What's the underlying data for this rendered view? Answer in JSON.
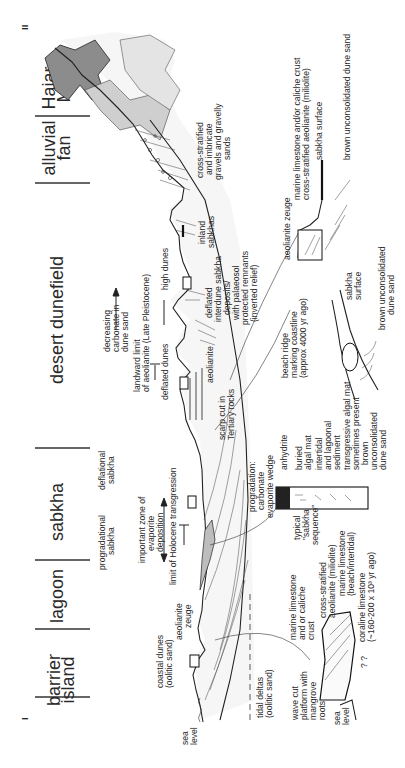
{
  "figure": {
    "orientation": "rotated-90-ccw",
    "section_markers": {
      "start": "I",
      "end": "II"
    }
  },
  "zones": [
    {
      "label_lines": [
        "barrier",
        "island"
      ]
    },
    {
      "label_lines": [
        "lagoon"
      ]
    },
    {
      "label_lines": [
        "sabkha"
      ]
    },
    {
      "label_lines": [
        "desert dunefield"
      ]
    },
    {
      "label_lines": [
        "alluvial",
        "fan"
      ]
    },
    {
      "label_lines": [
        "Hajar",
        "Mts"
      ]
    }
  ],
  "profile_labels": {
    "sea_level": [
      "sea",
      "level"
    ],
    "tidal_deltas": [
      "tidal deltas",
      "(oolitic sand)"
    ],
    "coastal_dunes": [
      "coastal dunes",
      "(oolitic sand)"
    ],
    "aeolianite_zeuge": [
      "aeolianite",
      "zeuge"
    ],
    "limit_holocene": [
      "limit of Holocene transgression"
    ],
    "evaporite_zone": [
      "important zone of",
      "evaporite",
      "deposition"
    ],
    "progradational_sabkha": [
      "progradational",
      "sabkha"
    ],
    "deflational_sabkha": [
      "deflational",
      "sabkha"
    ],
    "prograding_wedge": [
      "progradation:",
      "carbonate",
      "evaporite wedge"
    ],
    "scarp": [
      "scarp cut in",
      "Tertiary rocks"
    ],
    "aeolianite": [
      "aeolianite"
    ],
    "deflated_dunes": [
      "deflated dunes"
    ],
    "high_dunes": [
      "high dunes"
    ],
    "landward_limit": [
      "landward limit",
      "of aeolianite (Late Pleistocene)"
    ],
    "decreasing_carbonate": [
      "decreasing",
      "carbonate in",
      "dune sand"
    ],
    "interdune": [
      "deflated",
      "interdune sabkha",
      "deposits/",
      "with palaeosol",
      "protected remnants",
      "(inverted relief)"
    ],
    "inland_sabkhas": [
      "inland",
      "sabkhas"
    ],
    "alluvial_gravels": [
      "cross-stratified",
      "and imbricate",
      "gravels and gravelly",
      "sands"
    ]
  },
  "insets": {
    "coastal_detail": {
      "marine_limestone_crust": [
        "marine limestone",
        "and or caliche",
        "crust"
      ],
      "cross_stratified": [
        "cross-stratified",
        "aeolianite (miliolite)"
      ],
      "marine_limestone_beach": [
        "marine limestone",
        "(beach/intertidal)"
      ],
      "coraline": [
        "coraline limestone",
        "(~160-200 x 10³ yr ago)"
      ],
      "wave_cut": [
        "wave cut",
        "platform with",
        "mangrove",
        "roots"
      ],
      "sea_level": [
        "sea",
        "level"
      ],
      "question": "? ?"
    },
    "sabkha_sequence": {
      "title": [
        "typical",
        "\"sabkha",
        "sequence\""
      ],
      "layers": [
        [
          "anhydrite"
        ],
        [
          "buried",
          "algal mat"
        ],
        [
          "intertidal",
          "and lagoonal",
          "sediment"
        ],
        [
          "transgressive algal mat",
          "sometimes present"
        ],
        [
          "brown",
          "unconsolidated",
          "dune sand"
        ]
      ]
    },
    "beach_ridge": {
      "label": [
        "beach ridge",
        "marking coastline",
        "(approx 4000 yr ago)"
      ],
      "sabkha_surface": [
        "sabkha",
        "surface"
      ],
      "dune_sand": [
        "brown unconsolidated",
        "dune sand"
      ]
    },
    "aeolianite_zeuge": {
      "title": [
        "aeolianite zeuge"
      ],
      "crust": [
        "marine limestone and/or caliche crust"
      ],
      "miliolite": [
        "cross-stratified aeolianite (miliolite)"
      ],
      "sabkha_surface": [
        "sabkha surface"
      ],
      "dune_sand": [
        "brown unconsolidated dune sand"
      ]
    }
  },
  "colors": {
    "ink": "#222222",
    "fill_grey": "#bdbdbd",
    "dark_grey": "#7a7a7a",
    "light_grey": "#dcdcdc"
  }
}
